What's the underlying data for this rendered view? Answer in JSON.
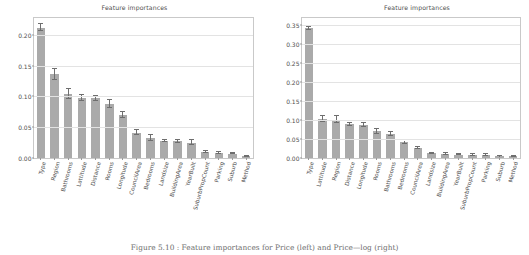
{
  "figure": {
    "caption": "Figure 5.10 :  Feature importances for Price (left) and Price—log (right)",
    "bar_color": "#aaaaaa",
    "error_color": "#6e6e6e",
    "grid_color": "#e3e3e3",
    "axes_color": "#c9c9c9",
    "background": "#ffffff"
  },
  "chart_data": [
    {
      "type": "bar",
      "panel": "left",
      "title": "Feature importances",
      "xlabel": "",
      "ylabel": "",
      "ylim": [
        0.0,
        0.2275
      ],
      "yticks": [
        "0.00",
        "0.05",
        "0.10",
        "0.15",
        "0.20"
      ],
      "ytick_values": [
        0.0,
        0.05,
        0.1,
        0.15,
        0.2
      ],
      "grid": true,
      "legend": "none",
      "categories": [
        "Type",
        "Region",
        "Bathrooms",
        "Lattitude",
        "Distance",
        "Rooms",
        "Longitude",
        "CouncilArea",
        "Bedrooms",
        "Landsize",
        "BuildingArea",
        "YearBuilt",
        "SuburbPropCount",
        "Parking",
        "Suburb",
        "Method"
      ],
      "values": [
        0.212,
        0.136,
        0.104,
        0.098,
        0.097,
        0.088,
        0.07,
        0.041,
        0.032,
        0.028,
        0.027,
        0.025,
        0.01,
        0.008,
        0.007,
        0.003
      ],
      "errors": [
        0.006,
        0.009,
        0.008,
        0.005,
        0.004,
        0.007,
        0.005,
        0.004,
        0.005,
        0.002,
        0.003,
        0.004,
        0.002,
        0.001,
        0.001,
        0.001
      ]
    },
    {
      "type": "bar",
      "panel": "right",
      "title": "Feature importances",
      "xlabel": "",
      "ylabel": "",
      "ylim": [
        0.0,
        0.3675
      ],
      "yticks": [
        "0.00",
        "0.05",
        "0.10",
        "0.15",
        "0.20",
        "0.25",
        "0.30",
        "0.35"
      ],
      "ytick_values": [
        0.0,
        0.05,
        0.1,
        0.15,
        0.2,
        0.25,
        0.3,
        0.35
      ],
      "grid": true,
      "legend": "none",
      "categories": [
        "Type",
        "Lattitude",
        "Region",
        "Distance",
        "Longitude",
        "Rooms",
        "Bathrooms",
        "Bedrooms",
        "CouncilArea",
        "Landsize",
        "BuildingArea",
        "YearBuilt",
        "SuburbPropCount",
        "Parking",
        "Suburb",
        "Method"
      ],
      "values": [
        0.341,
        0.103,
        0.101,
        0.089,
        0.086,
        0.07,
        0.063,
        0.041,
        0.026,
        0.012,
        0.01,
        0.009,
        0.008,
        0.008,
        0.005,
        0.004
      ],
      "errors": [
        0.004,
        0.008,
        0.008,
        0.004,
        0.005,
        0.006,
        0.004,
        0.005,
        0.003,
        0.002,
        0.002,
        0.002,
        0.002,
        0.002,
        0.001,
        0.001
      ]
    }
  ]
}
